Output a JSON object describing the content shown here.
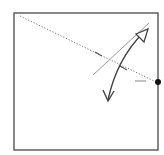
{
  "diagram": {
    "type": "origami-fold-step",
    "paper": {
      "shape": "square",
      "x": 14,
      "y": 13,
      "width": 144,
      "height": 137,
      "stroke": "#555555",
      "fill": "#ffffff"
    },
    "lines": [
      {
        "name": "valley-fold-dotted-line",
        "x1": 20,
        "y1": 16,
        "x2": 156,
        "y2": 82,
        "stroke": "#777777",
        "style": "dotted"
      },
      {
        "name": "fold-reference-thin-line",
        "x1": 93,
        "y1": 75,
        "x2": 149,
        "y2": 23,
        "stroke": "#9a9a9a",
        "style": "solid"
      },
      {
        "name": "crease-tick-1",
        "x1": 95,
        "y1": 52,
        "x2": 102,
        "y2": 56,
        "stroke": "#555555",
        "style": "solid"
      },
      {
        "name": "crease-tick-2",
        "x1": 120,
        "y1": 66,
        "x2": 127,
        "y2": 70,
        "stroke": "#555555",
        "style": "solid"
      },
      {
        "name": "edge-marker-dash",
        "x1": 135,
        "y1": 81,
        "x2": 146,
        "y2": 81,
        "stroke": "#9a9a9a",
        "style": "solid"
      }
    ],
    "reference_point": {
      "cx": 158,
      "cy": 82,
      "r": 3,
      "fill": "#111111"
    },
    "arrow": {
      "name": "fold-and-unfold-arrow",
      "path": "M108,100 C114,72 126,50 143,33",
      "stroke": "#444444",
      "head_open_top": "M136,34 L148,29 L144,42 Z",
      "head_v_bottom": "M103,90 L108,101 L114,91"
    }
  }
}
